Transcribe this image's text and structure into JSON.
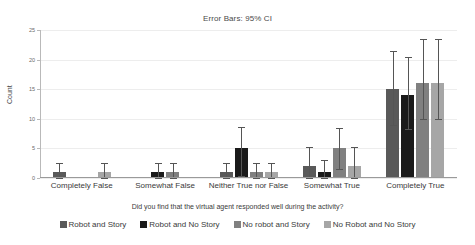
{
  "chart_data": {
    "type": "bar",
    "title": "Error Bars: 95% CI",
    "xlabel": "Did you find that the virtual agent responded well during the activity?",
    "ylabel": "Count",
    "ylim": [
      0,
      25
    ],
    "yticks": [
      0,
      5,
      10,
      15,
      20,
      25
    ],
    "ytick_labels": [
      "0",
      "5",
      "10",
      "15",
      "20",
      "25"
    ],
    "grid": true,
    "legend_position": "bottom",
    "error_bars": "95% CI",
    "categories": [
      "Completely False",
      "Somewhat False",
      "Neither True nor False",
      "Somewhat True",
      "Completely True"
    ],
    "series": [
      {
        "name": "Robot and Story",
        "color": "#595959",
        "values": [
          1,
          null,
          1,
          2,
          15
        ],
        "ci_low": [
          0,
          null,
          0,
          0,
          9
        ],
        "ci_high": [
          2.6,
          null,
          2.6,
          5.3,
          21.5
        ]
      },
      {
        "name": "Robot and No Story",
        "color": "#1a1a1a",
        "values": [
          null,
          1,
          5,
          1,
          14
        ],
        "ci_low": [
          null,
          0,
          0.3,
          0,
          8.3
        ],
        "ci_high": [
          null,
          2.6,
          8.6,
          3.1,
          20.5
        ]
      },
      {
        "name": "No robot and Story",
        "color": "#808080",
        "values": [
          null,
          1,
          1,
          5,
          16
        ],
        "ci_low": [
          null,
          0,
          0,
          1.5,
          10
        ],
        "ci_high": [
          null,
          2.6,
          2.6,
          8.4,
          23.5
        ]
      },
      {
        "name": "No Robot and No Story",
        "color": "#a6a6a6",
        "values": [
          1,
          null,
          1,
          2,
          16
        ],
        "ci_low": [
          0,
          null,
          0,
          0,
          10
        ],
        "ci_high": [
          2.6,
          null,
          2.6,
          5.3,
          23.5
        ]
      }
    ]
  }
}
